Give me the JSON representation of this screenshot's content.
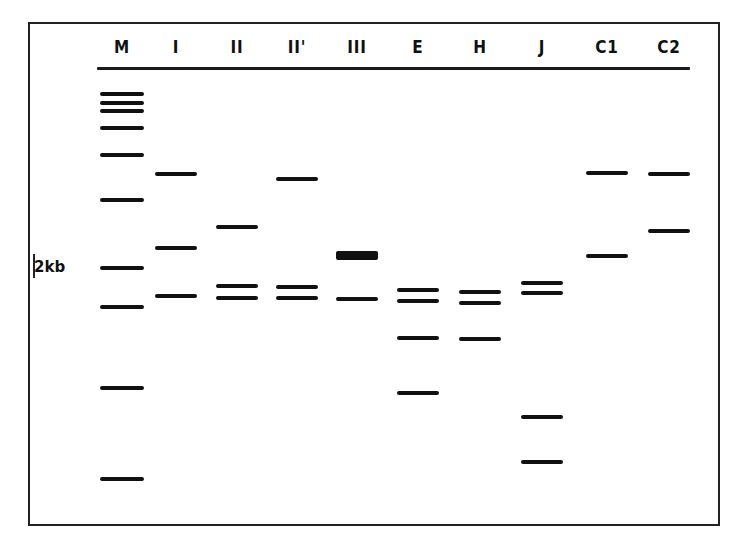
{
  "figure": {
    "marker_label": "2kb",
    "lanes": [
      {
        "label": "M",
        "x": 122,
        "bands": [
          94,
          103,
          111,
          128,
          155,
          200,
          268,
          307,
          388,
          479
        ],
        "w": 44
      },
      {
        "label": "I",
        "x": 176,
        "bands": [
          174,
          248,
          296
        ],
        "w": 42
      },
      {
        "label": "II",
        "x": 237,
        "bands": [
          227,
          286,
          298
        ],
        "w": 42
      },
      {
        "label": "II'",
        "x": 297,
        "bands": [
          179,
          287,
          298
        ],
        "w": 42
      },
      {
        "label": "III",
        "x": 357,
        "bands": [
          299
        ],
        "thick_bands": [
          255
        ],
        "w": 42
      },
      {
        "label": "E",
        "x": 418,
        "bands": [
          290,
          301,
          338,
          393
        ],
        "w": 42
      },
      {
        "label": "H",
        "x": 480,
        "bands": [
          292,
          303,
          339
        ],
        "w": 42
      },
      {
        "label": "J",
        "x": 542,
        "bands": [
          283,
          293,
          417,
          462
        ],
        "w": 42
      },
      {
        "label": "C1",
        "x": 607,
        "bands": [
          173,
          256
        ],
        "w": 42
      },
      {
        "label": "C2",
        "x": 669,
        "bands": [
          174,
          231
        ],
        "w": 42
      }
    ]
  }
}
